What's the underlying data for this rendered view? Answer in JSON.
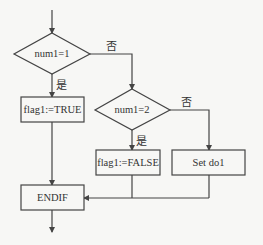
{
  "diagram": {
    "type": "flowchart",
    "colors": {
      "stroke": "#444444",
      "text": "#333333",
      "background": "#f7f7f5"
    },
    "nodes": {
      "decision1": {
        "label": "num1=1",
        "shape": "diamond"
      },
      "process_true": {
        "label": "flag1:=TRUE",
        "shape": "rect"
      },
      "decision2": {
        "label": "num1=2",
        "shape": "diamond"
      },
      "process_false": {
        "label": "flag1:=FALSE",
        "shape": "rect"
      },
      "process_setdo": {
        "label": "Set do1",
        "shape": "rect"
      },
      "endif": {
        "label": "ENDIF",
        "shape": "rect"
      }
    },
    "edges": {
      "d1_yes": {
        "label": "是",
        "from": "decision1",
        "to": "process_true"
      },
      "d1_no": {
        "label": "否",
        "from": "decision1",
        "to": "decision2"
      },
      "d2_yes": {
        "label": "是",
        "from": "decision2",
        "to": "process_false"
      },
      "d2_no": {
        "label": "否",
        "from": "decision2",
        "to": "process_setdo"
      },
      "true_to_endif": {
        "label": "",
        "from": "process_true",
        "to": "endif"
      },
      "false_to_endif": {
        "label": "",
        "from": "process_false",
        "to": "endif"
      },
      "setdo_to_endif": {
        "label": "",
        "from": "process_setdo",
        "to": "endif"
      }
    }
  }
}
